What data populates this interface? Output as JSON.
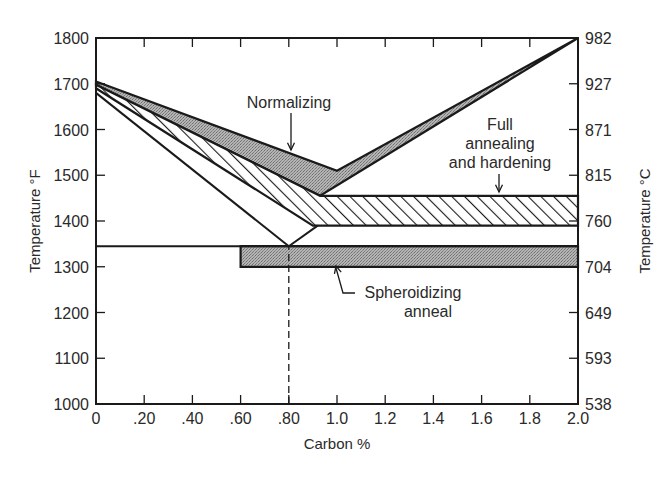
{
  "chart_data": {
    "type": "area",
    "title": "",
    "xlabel": "Carbon %",
    "ylabel": "Temperature °F",
    "ylabel_right": "Temperature °C",
    "xlim": [
      0,
      2.0
    ],
    "ylim": [
      1000,
      1800
    ],
    "grid": false,
    "x_ticks": [
      "0",
      ".20",
      ".40",
      ".60",
      ".80",
      "1.0",
      "1.2",
      "1.4",
      "1.6",
      "1.8",
      "2.0"
    ],
    "x_tick_values": [
      0,
      0.2,
      0.4,
      0.6,
      0.8,
      1.0,
      1.2,
      1.4,
      1.6,
      1.8,
      2.0
    ],
    "y_ticks_left": [
      "1800",
      "1700",
      "1600",
      "1500",
      "1400",
      "1300",
      "1200",
      "1100",
      "1000"
    ],
    "y_tick_values_left": [
      1800,
      1700,
      1600,
      1500,
      1400,
      1300,
      1200,
      1100,
      1000
    ],
    "y_ticks_right": [
      "982",
      "927",
      "871",
      "815",
      "760",
      "704",
      "649",
      "593",
      "538"
    ],
    "series": [
      {
        "name": "Normalizing",
        "fill": "stippled-gray",
        "polygon": [
          [
            0,
            1705
          ],
          [
            1.0,
            1510
          ],
          [
            2.0,
            1800
          ],
          [
            0.93,
            1455
          ],
          [
            0,
            1698
          ]
        ]
      },
      {
        "name": "Full annealing and hardening",
        "fill": "hatched",
        "polygon": [
          [
            0,
            1698
          ],
          [
            0.93,
            1455
          ],
          [
            2.0,
            1455
          ],
          [
            2.0,
            1390
          ],
          [
            0.9,
            1390
          ],
          [
            0,
            1690
          ]
        ]
      },
      {
        "name": "Spheroidizing anneal",
        "fill": "stippled-gray",
        "polygon": [
          [
            0.6,
            1345
          ],
          [
            2.0,
            1345
          ],
          [
            2.0,
            1300
          ],
          [
            0.6,
            1300
          ]
        ]
      }
    ],
    "lines": [
      {
        "name": "A3 line",
        "points": [
          [
            0,
            1680
          ],
          [
            0.8,
            1345
          ]
        ]
      },
      {
        "name": "Acm line",
        "points": [
          [
            0.8,
            1345
          ],
          [
            0.92,
            1390
          ]
        ]
      },
      {
        "name": "A1 line",
        "points": [
          [
            0,
            1345
          ],
          [
            2.0,
            1345
          ]
        ]
      },
      {
        "name": "Eutectoid composition (dashed)",
        "points": [
          [
            0.8,
            1000
          ],
          [
            0.8,
            1345
          ]
        ],
        "style": "dashed"
      }
    ],
    "annotations": [
      {
        "text": "Normalizing",
        "arrow_to": [
          0.8,
          1530
        ]
      },
      {
        "text": "Full annealing and hardening",
        "arrow_to": [
          1.67,
          1455
        ]
      },
      {
        "text": "Spheroidizing anneal",
        "arrow_to": [
          1.0,
          1300
        ]
      }
    ]
  },
  "labels": {
    "xlabel": "Carbon %",
    "ylabel_left": "Temperature °F",
    "ylabel_right": "Temperature °C",
    "normalizing": "Normalizing",
    "full_line1": "Full",
    "full_line2": "annealing",
    "full_line3": "and hardening",
    "sph_line1": "Spheroidizing",
    "sph_line2": "anneal"
  },
  "colors": {
    "line": "#1a1a1a",
    "stipple": "#a8a8a8",
    "background": "#ffffff"
  }
}
